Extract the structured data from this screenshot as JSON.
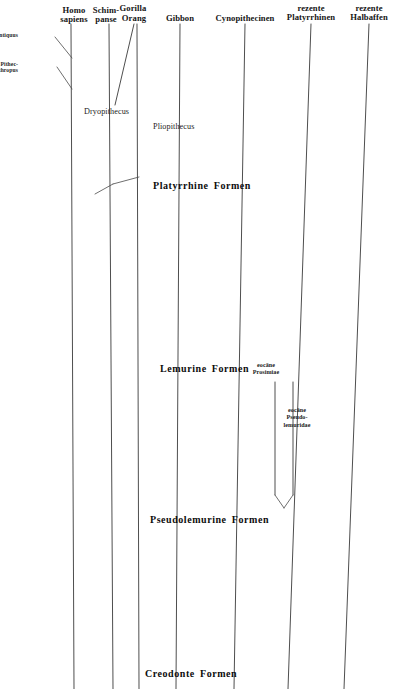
{
  "figure": {
    "kind": "phylogenetic-tree",
    "language": "de",
    "background_color": "#ffffff",
    "line_color": "#3a3a3a",
    "text_color": "#1a1a1a",
    "width": 396,
    "height": 689
  },
  "column_headers": [
    {
      "id": "homo-sapiens",
      "lines": [
        "Homo",
        "sapiens"
      ],
      "x": 74,
      "y": 6
    },
    {
      "id": "schimpanse",
      "lines": [
        "Schim-",
        "panse"
      ],
      "x": 106,
      "y": 6
    },
    {
      "id": "gorilla",
      "lines": [
        "Gorilla"
      ],
      "x": 133,
      "y": 4
    },
    {
      "id": "orang",
      "lines": [
        "Orang"
      ],
      "x": 134,
      "y": 14
    },
    {
      "id": "gibbon",
      "lines": [
        "Gibbon"
      ],
      "x": 180,
      "y": 14
    },
    {
      "id": "cynopithecinen",
      "lines": [
        "Cynopithecinen"
      ],
      "x": 245,
      "y": 14
    },
    {
      "id": "rezente-platyrrhinen",
      "lines": [
        "rezente",
        "Platyrrhinen"
      ],
      "x": 311,
      "y": 4
    },
    {
      "id": "rezente-halbaffen",
      "lines": [
        "rezente",
        "Halbaffen"
      ],
      "x": 369,
      "y": 4
    }
  ],
  "side_notes": [
    {
      "id": "homo-antiquus",
      "lines": [
        "Homo antiquus"
      ],
      "x": 18,
      "y": 33
    },
    {
      "id": "pithecanthropus",
      "lines": [
        "Pithec-",
        "anthropus"
      ],
      "x": 18,
      "y": 62
    }
  ],
  "genus_labels": [
    {
      "id": "dryopithecus",
      "text": "Dryopithecus",
      "x": 84,
      "y": 108
    },
    {
      "id": "pliopithecus",
      "text": "Pliopithecus",
      "x": 153,
      "y": 123
    }
  ],
  "band_titles": [
    {
      "id": "platyrrhine-formen",
      "text": "Platyrrhine Formen",
      "x": 153,
      "y": 181
    },
    {
      "id": "lemurine-formen",
      "text": "Lemurine Formen",
      "x": 160,
      "y": 364
    },
    {
      "id": "pseudolemurine-formen",
      "text": "Pseudolemurine Formen",
      "x": 150,
      "y": 515
    },
    {
      "id": "creodonte-formen",
      "text": "Creodonte Formen",
      "x": 145,
      "y": 669
    }
  ],
  "fossil_notes": [
    {
      "id": "eocaene-prosimiae",
      "lines": [
        "eocäne",
        "Prosimiae"
      ],
      "x": 266,
      "y": 362
    },
    {
      "id": "eocaene-pseudolemuridae",
      "lines": [
        "eocäne",
        "Pseudo-",
        "lemuridae"
      ],
      "x": 297,
      "y": 407
    }
  ],
  "lineages": [
    {
      "id": "homo-sapiens-lineage",
      "x1": 71,
      "y1": 24,
      "x2": 74,
      "y2": 689
    },
    {
      "id": "schimpanse-lineage",
      "x1": 109,
      "y1": 24,
      "x2": 113,
      "y2": 689
    },
    {
      "id": "gorilla-lineage",
      "x1": 134,
      "y1": 24,
      "x2": 115,
      "y2": 105
    },
    {
      "id": "orang-lineage",
      "x1": 137,
      "y1": 24,
      "x2": 139,
      "y2": 689
    },
    {
      "id": "gibbon-lineage",
      "x1": 180,
      "y1": 24,
      "x2": 176,
      "y2": 689
    },
    {
      "id": "cynopithecinen-lineage",
      "x1": 245,
      "y1": 24,
      "x2": 234,
      "y2": 689
    },
    {
      "id": "platyrrhinen-lineage",
      "x1": 311,
      "y1": 24,
      "x2": 288,
      "y2": 689
    },
    {
      "id": "halbaffen-lineage",
      "x1": 369,
      "y1": 24,
      "x2": 344,
      "y2": 689
    },
    {
      "id": "pseudolemuridae-left-branch",
      "x1": 275,
      "y1": 382,
      "x2": 275,
      "y2": 495
    },
    {
      "id": "pseudolemuridae-right-branch",
      "x1": 293,
      "y1": 382,
      "x2": 293,
      "y2": 495
    }
  ],
  "connectors": [
    {
      "id": "homo-antiquus-leader",
      "x1": 55,
      "y1": 37,
      "x2": 72,
      "y2": 58
    },
    {
      "id": "pithecanthropus-leader",
      "x1": 57,
      "y1": 67,
      "x2": 72,
      "y2": 89
    },
    {
      "id": "dryopithecus-stem",
      "x1": 113,
      "y1": 184,
      "x2": 139,
      "y2": 177
    },
    {
      "id": "dryopithecus-tick",
      "x1": 113,
      "y1": 184,
      "x2": 95,
      "y2": 194
    },
    {
      "id": "pseudolemuridae-v-left",
      "x1": 275,
      "y1": 495,
      "x2": 284,
      "y2": 508
    },
    {
      "id": "pseudolemuridae-v-right",
      "x1": 293,
      "y1": 495,
      "x2": 284,
      "y2": 508
    }
  ]
}
